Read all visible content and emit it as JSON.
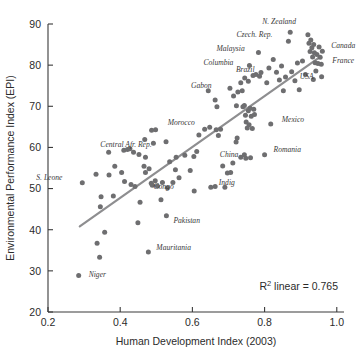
{
  "chart_data": {
    "type": "scatter",
    "title": "",
    "xlabel": "Human Development Index (2003)",
    "ylabel": "Environmental Performance Index (EPI)",
    "xlim": [
      0.2,
      1.02
    ],
    "ylim": [
      20,
      90
    ],
    "xticks": [
      "0.2",
      "0.4",
      "0.6",
      "0.8",
      "1.0"
    ],
    "xtick_values": [
      0.2,
      0.4,
      0.6,
      0.8,
      1.0
    ],
    "yticks": [
      "20",
      "30",
      "40",
      "50",
      "60",
      "70",
      "80",
      "90"
    ],
    "ytick_values": [
      20,
      30,
      40,
      50,
      60,
      70,
      80,
      90
    ],
    "grid": false,
    "legend": null,
    "annotation": "R² linear = 0.765",
    "r2": 0.765,
    "trendline": {
      "type": "linear",
      "color": "#8e8e90",
      "x0": 0.288,
      "y0": 40.8,
      "x1": 0.952,
      "y1": 81.9
    },
    "point_color": "#6e6e70",
    "points": [
      {
        "x": 0.285,
        "y": 28.9,
        "label": "Niger",
        "label_dx": 10,
        "label_dy": 2
      },
      {
        "x": 0.343,
        "y": 33.3
      },
      {
        "x": 0.336,
        "y": 36.7
      },
      {
        "x": 0.357,
        "y": 39.4
      },
      {
        "x": 0.449,
        "y": 41.7
      },
      {
        "x": 0.478,
        "y": 34.6,
        "label": "Mauritania",
        "label_dx": 8,
        "label_dy": -2
      },
      {
        "x": 0.528,
        "y": 43.4,
        "label": "Pakistan",
        "label_dx": 7,
        "label_dy": 7
      },
      {
        "x": 0.345,
        "y": 45.6
      },
      {
        "x": 0.347,
        "y": 48.0
      },
      {
        "x": 0.381,
        "y": 48.2
      },
      {
        "x": 0.455,
        "y": 46.7
      },
      {
        "x": 0.513,
        "y": 47.3
      },
      {
        "x": 0.295,
        "y": 51.4,
        "label": "S. Leone",
        "label_dx": -46,
        "label_dy": -3
      },
      {
        "x": 0.369,
        "y": 53.3
      },
      {
        "x": 0.385,
        "y": 55.4
      },
      {
        "x": 0.412,
        "y": 51.7
      },
      {
        "x": 0.441,
        "y": 50.5
      },
      {
        "x": 0.47,
        "y": 53.9
      },
      {
        "x": 0.489,
        "y": 50.8
      },
      {
        "x": 0.497,
        "y": 51.9
      },
      {
        "x": 0.503,
        "y": 50.6
      },
      {
        "x": 0.517,
        "y": 51.5,
        "label": "Congo",
        "label_dx": -9,
        "label_dy": 7
      },
      {
        "x": 0.531,
        "y": 50.2
      },
      {
        "x": 0.546,
        "y": 51.5
      },
      {
        "x": 0.563,
        "y": 52.6
      },
      {
        "x": 0.605,
        "y": 49.4
      },
      {
        "x": 0.651,
        "y": 50.3,
        "label": "Indig",
        "label_dx": 8,
        "label_dy": -2
      },
      {
        "x": 0.663,
        "y": 50.5
      },
      {
        "x": 0.69,
        "y": 50.3
      },
      {
        "x": 0.368,
        "y": 58.8
      },
      {
        "x": 0.41,
        "y": 59.3
      },
      {
        "x": 0.42,
        "y": 59.5
      },
      {
        "x": 0.427,
        "y": 59.7
      },
      {
        "x": 0.437,
        "y": 58.8
      },
      {
        "x": 0.452,
        "y": 58.3
      },
      {
        "x": 0.47,
        "y": 57.6
      },
      {
        "x": 0.468,
        "y": 61.9
      },
      {
        "x": 0.487,
        "y": 64.2
      },
      {
        "x": 0.498,
        "y": 64.3
      },
      {
        "x": 0.492,
        "y": 61.0
      },
      {
        "x": 0.527,
        "y": 61.4
      },
      {
        "x": 0.466,
        "y": 55.4
      },
      {
        "x": 0.48,
        "y": 54.8
      },
      {
        "x": 0.537,
        "y": 56.5
      },
      {
        "x": 0.555,
        "y": 57.6
      },
      {
        "x": 0.579,
        "y": 58.1
      },
      {
        "x": 0.604,
        "y": 57.8
      },
      {
        "x": 0.612,
        "y": 59.0
      },
      {
        "x": 0.618,
        "y": 63.0
      },
      {
        "x": 0.634,
        "y": 64.4
      },
      {
        "x": 0.644,
        "y": 73.8
      },
      {
        "x": 0.648,
        "y": 64.9,
        "label": "Morocco",
        "label_dx": -42,
        "label_dy": -2
      },
      {
        "x": 0.663,
        "y": 71.5
      },
      {
        "x": 0.668,
        "y": 69.9
      },
      {
        "x": 0.666,
        "y": 64.3
      },
      {
        "x": 0.678,
        "y": 64.4
      },
      {
        "x": 0.684,
        "y": 55.5
      },
      {
        "x": 0.697,
        "y": 53.8
      },
      {
        "x": 0.706,
        "y": 53.9
      },
      {
        "x": 0.712,
        "y": 56.2
      },
      {
        "x": 0.721,
        "y": 61.3
      },
      {
        "x": 0.724,
        "y": 62.3
      },
      {
        "x": 0.734,
        "y": 57.6
      },
      {
        "x": 0.744,
        "y": 58.2
      },
      {
        "x": 0.748,
        "y": 57.4,
        "label": "China",
        "label_dx": -26,
        "label_dy": -1
      },
      {
        "x": 0.761,
        "y": 57.5
      },
      {
        "x": 0.8,
        "y": 58.2,
        "label": "Romania",
        "label_dx": 9,
        "label_dy": -3
      },
      {
        "x": 0.704,
        "y": 74.4
      },
      {
        "x": 0.714,
        "y": 72.5
      },
      {
        "x": 0.722,
        "y": 70.1
      },
      {
        "x": 0.726,
        "y": 73.5
      },
      {
        "x": 0.734,
        "y": 75.7
      },
      {
        "x": 0.738,
        "y": 73.8
      },
      {
        "x": 0.74,
        "y": 69.9
      },
      {
        "x": 0.744,
        "y": 70.2
      },
      {
        "x": 0.747,
        "y": 67.8
      },
      {
        "x": 0.749,
        "y": 66.2
      },
      {
        "x": 0.752,
        "y": 64.7
      },
      {
        "x": 0.755,
        "y": 68.9
      },
      {
        "x": 0.757,
        "y": 65.5
      },
      {
        "x": 0.76,
        "y": 69.5
      },
      {
        "x": 0.763,
        "y": 67.6
      },
      {
        "x": 0.766,
        "y": 64.6
      },
      {
        "x": 0.77,
        "y": 69.3
      },
      {
        "x": 0.772,
        "y": 68.0
      },
      {
        "x": 0.768,
        "y": 77.5
      },
      {
        "x": 0.758,
        "y": 79.9,
        "label": "Columbia",
        "label_dx": -46,
        "label_dy": -1
      },
      {
        "x": 0.776,
        "y": 77.7,
        "label": "Brazil",
        "label_dx": -20,
        "label_dy": -3
      },
      {
        "x": 0.786,
        "y": 77.3
      },
      {
        "x": 0.79,
        "y": 78.2
      },
      {
        "x": 0.783,
        "y": 83.1,
        "label": "Malaysia",
        "label_dx": -42,
        "label_dy": -1
      },
      {
        "x": 0.806,
        "y": 75.7
      },
      {
        "x": 0.817,
        "y": 65.7,
        "label": "Mexico",
        "label_dx": 11,
        "label_dy": -2
      },
      {
        "x": 0.812,
        "y": 79.3
      },
      {
        "x": 0.824,
        "y": 81.4
      },
      {
        "x": 0.833,
        "y": 78.3
      },
      {
        "x": 0.841,
        "y": 76.4
      },
      {
        "x": 0.847,
        "y": 79.8
      },
      {
        "x": 0.852,
        "y": 73.8
      },
      {
        "x": 0.858,
        "y": 77.1
      },
      {
        "x": 0.866,
        "y": 85.8,
        "label": "Czech. Rep.",
        "label_dx": -52,
        "label_dy": -4
      },
      {
        "x": 0.871,
        "y": 88.0,
        "label": "N. Zealand",
        "label_dx": -28,
        "label_dy": -8
      },
      {
        "x": 0.875,
        "y": 78.4
      },
      {
        "x": 0.884,
        "y": 76.2
      },
      {
        "x": 0.891,
        "y": 80.5
      },
      {
        "x": 0.896,
        "y": 74.0
      },
      {
        "x": 0.905,
        "y": 81.0
      },
      {
        "x": 0.913,
        "y": 77.7
      },
      {
        "x": 0.92,
        "y": 87.4
      },
      {
        "x": 0.923,
        "y": 85.3
      },
      {
        "x": 0.926,
        "y": 83.3
      },
      {
        "x": 0.928,
        "y": 86.1
      },
      {
        "x": 0.931,
        "y": 84.2
      },
      {
        "x": 0.933,
        "y": 82.0
      },
      {
        "x": 0.936,
        "y": 85.0
      },
      {
        "x": 0.938,
        "y": 83.0
      },
      {
        "x": 0.94,
        "y": 80.6
      },
      {
        "x": 0.942,
        "y": 78.6,
        "label": "USA",
        "label_dx": -16,
        "label_dy": 8
      },
      {
        "x": 0.945,
        "y": 82.6
      },
      {
        "x": 0.948,
        "y": 80.4
      },
      {
        "x": 0.951,
        "y": 84.4
      },
      {
        "x": 0.954,
        "y": 81.9,
        "label": "Canada",
        "label_dx": 11,
        "label_dy": -9
      },
      {
        "x": 0.957,
        "y": 80.2,
        "label": "France",
        "label_dx": 11,
        "label_dy": -1
      },
      {
        "x": 0.96,
        "y": 83.4
      },
      {
        "x": 0.958,
        "y": 77.2
      },
      {
        "x": 0.935,
        "y": 76.5
      },
      {
        "x": 0.755,
        "y": 76.1
      },
      {
        "x": 0.745,
        "y": 76.9
      },
      {
        "x": 0.672,
        "y": 62.9
      },
      {
        "x": 0.553,
        "y": 54.6
      },
      {
        "x": 0.594,
        "y": 54.4
      },
      {
        "x": 0.333,
        "y": 53.5
      },
      {
        "x": 0.404,
        "y": 53.9
      },
      {
        "x": 0.43,
        "y": 51.0
      },
      {
        "x": 0.486,
        "y": 51.3
      }
    ],
    "labels": [
      "Niger",
      "Mauritania",
      "Pakistan",
      "S. Leone",
      "Congo",
      "Indig",
      "Central Afr. Rep.",
      "Morocco",
      "China",
      "Romania",
      "Gabon",
      "Columbia",
      "Brazil",
      "Malaysia",
      "Mexico",
      "Czech. Rep.",
      "N. Zealand",
      "USA",
      "Canada",
      "France"
    ],
    "extra_labels": [
      {
        "text": "Central Afr. Rep.",
        "x": 0.345,
        "y": 60.2,
        "anchor": "start"
      },
      {
        "text": "Gabon",
        "x": 0.596,
        "y": 74.4,
        "anchor": "start"
      }
    ]
  },
  "caption": {
    "figure_label": "FIGURE 1",
    "text": "Relationship of 2008 EPI and human environmental..."
  }
}
